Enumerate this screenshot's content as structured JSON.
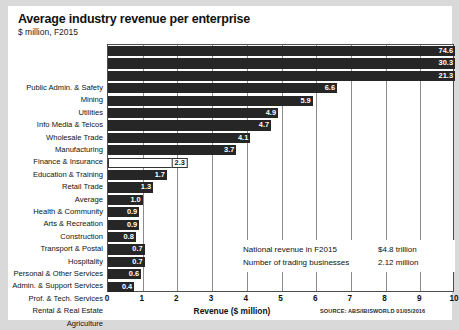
{
  "chart_data": {
    "type": "bar",
    "orientation": "horizontal",
    "title": "Average industry revenue per enterprise",
    "subtitle": "$ million, F2015",
    "xlabel": "Revenue ($ million)",
    "ylabel": "",
    "xlim": [
      0,
      10
    ],
    "xticks": [
      "0",
      "1",
      "2",
      "3",
      "4",
      "5",
      "6",
      "7",
      "8",
      "9",
      "10"
    ],
    "grid": true,
    "legend": "none",
    "note": "Bars for Public Admin. & Safety, Mining and Utilities extend beyond the 10 axis maximum and are clipped at the plot edge.",
    "categories": [
      "Public Admin. & Safety",
      "Mining",
      "Utilities",
      "Info Media & Telcos",
      "Wholesale Trade",
      "Manufacturing",
      "Finance & Insurance",
      "Education & Training",
      "Retail Trade",
      "Average",
      "Health & Community",
      "Arts & Recreation",
      "Construction",
      "Transport & Postal",
      "Hospitality",
      "Personal & Other Services",
      "Admin. & Support Services",
      "Prof. & Tech. Services",
      "Rental & Real Estate",
      "Agriculture"
    ],
    "values": [
      74.6,
      30.3,
      21.3,
      6.6,
      5.9,
      4.9,
      4.7,
      4.1,
      3.7,
      2.3,
      1.7,
      1.3,
      1.0,
      0.9,
      0.9,
      0.8,
      0.7,
      0.7,
      0.6,
      0.4
    ],
    "value_labels": [
      "74.6",
      "30.3",
      "21.3",
      "6.6",
      "5.9",
      "4.9",
      "4.7",
      "4.1",
      "3.7",
      "2.3",
      "1.7",
      "1.3",
      "1.0",
      "0.9",
      "0.9",
      "0.8",
      "0.7",
      "0.7",
      "0.6",
      "0.4"
    ],
    "highlight_category": "Average",
    "colors": {
      "bar": "#262626",
      "average_bar": "#ffffff",
      "average_border": "#333333",
      "grid": "#8c8c8c",
      "axis": "#4d4d4d",
      "text": "#111111",
      "page_background": "#d9d9d9",
      "card_background": "#ffffff"
    }
  },
  "annotation": {
    "rows": [
      {
        "label": "National revenue in F2015",
        "value": "$4.8 trillion"
      },
      {
        "label": "Number of trading businesses",
        "value": "2.12 million"
      }
    ]
  },
  "footer": {
    "source": "SOURCE: ABS/IBISWORLD 01/05/2016"
  }
}
